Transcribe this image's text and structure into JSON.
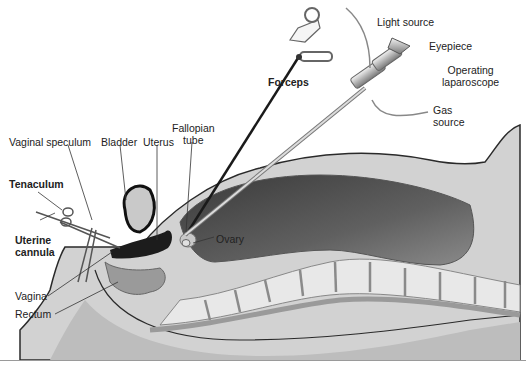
{
  "diagram": {
    "labels": {
      "light_source": "Light source",
      "eyepiece": "Eyepiece",
      "operating_laparoscope_1": "Operating",
      "operating_laparoscope_2": "laparoscope",
      "forceps": "Forceps",
      "gas_source_1": "Gas",
      "gas_source_2": "source",
      "vaginal_speculum": "Vaginal speculum",
      "bladder": "Bladder",
      "uterus": "Uterus",
      "fallopian_tube_1": "Fallopian",
      "fallopian_tube_2": "tube",
      "tenaculum": "Tenaculum",
      "uterine_cannula_1": "Uterine",
      "uterine_cannula_2": "cannula",
      "ovary": "Ovary",
      "vagina": "Vagina",
      "rectum": "Rectum"
    },
    "colors": {
      "body_tissue": "#d4d4d4",
      "abdominal_cavity": "#555555",
      "skin_outline": "#2a2a2a",
      "spine": "#e6e6e6"
    }
  }
}
